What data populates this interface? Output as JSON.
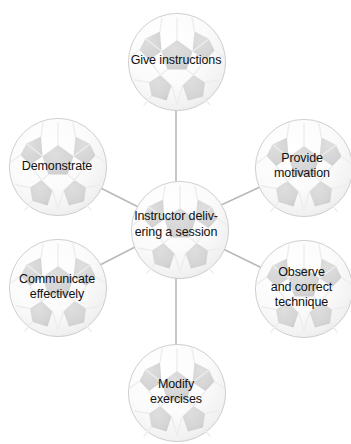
{
  "diagram": {
    "type": "hub-and-spoke mind map",
    "theme": "football (soccer ball) nodes",
    "background_color": "#ffffff",
    "node_fill_color": "#fbfbfb",
    "node_patch_color": "#d6d6d6",
    "node_outline_color": "#c9c9c9",
    "connector_color": "#b9b9b9",
    "text_color": "#111111",
    "center": {
      "id": "instructor-delivering-a-session",
      "label": "Instructor deliv-\nering a session",
      "cx": 176,
      "cy": 226,
      "r": 46
    },
    "nodes": [
      {
        "id": "give-instructions",
        "label": "Give instructions",
        "cx": 176,
        "cy": 61,
        "r": 49,
        "position": "top"
      },
      {
        "id": "provide-motivation",
        "label": "Provide\nmotivation",
        "cx": 303,
        "cy": 167,
        "r": 49,
        "position": "top-right"
      },
      {
        "id": "observe-and-correct-technique",
        "label": "Observe\nand correct\ntechnique",
        "cx": 303,
        "cy": 288,
        "r": 49,
        "position": "bottom-right"
      },
      {
        "id": "modify-exercises",
        "label": "Modify\nexercises",
        "cx": 176,
        "cy": 392,
        "r": 49,
        "position": "bottom"
      },
      {
        "id": "communicate-effectively",
        "label": "Communicate\neffectively",
        "cx": 57,
        "cy": 287,
        "r": 49,
        "position": "bottom-left"
      },
      {
        "id": "demonstrate",
        "label": "Demonstrate",
        "cx": 57,
        "cy": 166,
        "r": 49,
        "position": "top-left"
      }
    ],
    "connectors": [
      {
        "from": "instructor-delivering-a-session",
        "to": "give-instructions"
      },
      {
        "from": "instructor-delivering-a-session",
        "to": "provide-motivation"
      },
      {
        "from": "instructor-delivering-a-session",
        "to": "observe-and-correct-technique"
      },
      {
        "from": "instructor-delivering-a-session",
        "to": "modify-exercises"
      },
      {
        "from": "instructor-delivering-a-session",
        "to": "communicate-effectively"
      },
      {
        "from": "instructor-delivering-a-session",
        "to": "demonstrate"
      }
    ]
  }
}
